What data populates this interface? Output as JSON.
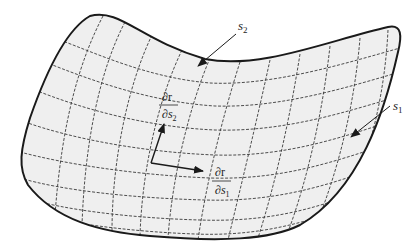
{
  "diagram": {
    "type": "parametric-surface",
    "colors": {
      "surface_fill": "#efefef",
      "boundary": "#1a1a1a",
      "grid": "#3a3a3a",
      "arrow": "#1a1a1a"
    },
    "labels": {
      "s1": {
        "base": "s",
        "sub": "1"
      },
      "s2": {
        "base": "s",
        "sub": "2"
      },
      "dr_ds1": {
        "numerator": "∂r",
        "denominator_base": "∂s",
        "denominator_sub": "1"
      },
      "dr_ds2": {
        "numerator": "∂r",
        "denominator_base": "∂s",
        "denominator_sub": "2"
      }
    }
  }
}
